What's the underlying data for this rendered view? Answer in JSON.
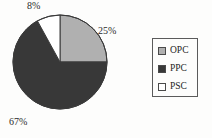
{
  "figure": {
    "background_color": "#fdfdfc",
    "ink_color": "#2b2b2b"
  },
  "pie": {
    "center_x": 48,
    "center_y": 48,
    "radius": 47,
    "outline_color": "#3a3a3a",
    "start_angle_deg": 0
  },
  "labels": {
    "opc_pct": "25%",
    "ppc_pct": "67%",
    "psc_pct": "8%"
  },
  "legend": {
    "border_color": "#5b5b5b",
    "items": [
      {
        "label": "OPC",
        "color": "#b0b0b0",
        "swatch_name": "legend-swatch-opc"
      },
      {
        "label": "PPC",
        "color": "#383838",
        "swatch_name": "legend-swatch-ppc"
      },
      {
        "label": "PSC",
        "color": "#ffffff",
        "swatch_name": "legend-swatch-psc"
      }
    ]
  },
  "chart_data": {
    "type": "pie",
    "title": "",
    "subtitle": "",
    "xlabel": "",
    "ylabel": "",
    "grid": false,
    "legend_position": "right",
    "categories": [
      "OPC",
      "PPC",
      "PSC"
    ],
    "values": [
      25,
      67,
      8
    ],
    "unit": "%",
    "data_labels": [
      "25%",
      "67%",
      "8%"
    ],
    "colors": [
      "#b0b0b0",
      "#383838",
      "#ffffff"
    ],
    "slice_order_clockwise_from_top": [
      "OPC",
      "PPC",
      "PSC"
    ],
    "series": [
      {
        "name": "Share",
        "values": [
          25,
          67,
          8
        ]
      }
    ],
    "annotations": [
      {
        "text": "25%",
        "attached_to": "OPC",
        "position": "outside-right"
      },
      {
        "text": "67%",
        "attached_to": "PPC",
        "position": "outside-bottom-left"
      },
      {
        "text": "8%",
        "attached_to": "PSC",
        "position": "outside-top"
      }
    ]
  }
}
